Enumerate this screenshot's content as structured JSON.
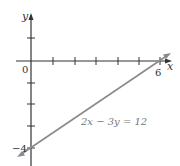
{
  "graph": {
    "equation_label": "2x − 3y = 12",
    "x_axis_label": "x",
    "y_axis_label": "y",
    "origin_label": "0",
    "x_intercept_label": "6",
    "y_intercept_label": "−4",
    "line_color": "#8a8a8a",
    "axis_color": "#333333",
    "x_intercept": [
      6,
      0
    ],
    "y_intercept": [
      0,
      -4
    ],
    "x_ticks": [
      1,
      2,
      3,
      4,
      5,
      6
    ],
    "y_ticks": [
      1,
      -1,
      -2,
      -3,
      -4
    ]
  }
}
